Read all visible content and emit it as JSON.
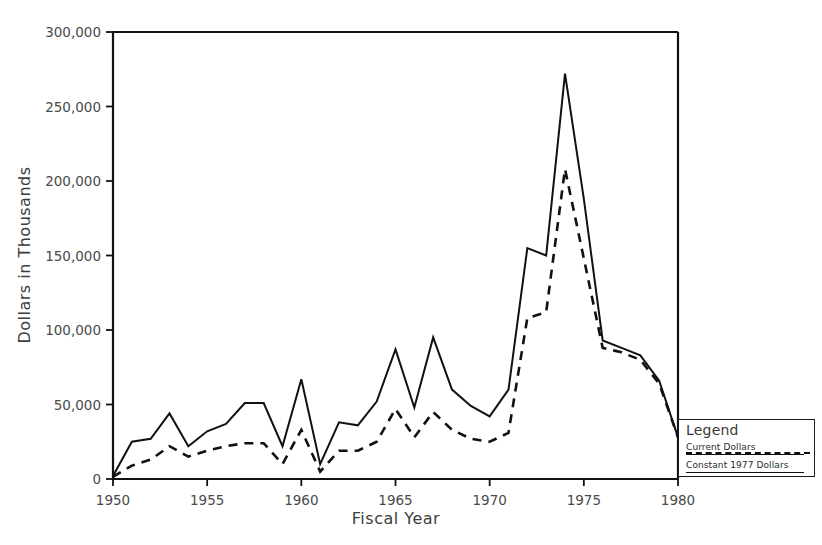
{
  "title": "",
  "axes": {
    "x_title": "Fiscal Year",
    "y_title": "Dollars in Thousands",
    "x_ticks": [
      "1950",
      "1955",
      "1960",
      "1965",
      "1970",
      "1975",
      "1980"
    ],
    "y_ticks": [
      "0",
      "50,000",
      "100,000",
      "150,000",
      "200,000",
      "250,000",
      "300,000"
    ]
  },
  "legend": {
    "title": "Legend",
    "entries": [
      {
        "label": "Current Dollars",
        "style": "solid"
      },
      {
        "label": "Constant 1977 Dollars",
        "style": "dashed"
      }
    ]
  },
  "chart_data": {
    "type": "line",
    "title": "",
    "xlabel": "Fiscal Year",
    "ylabel": "Dollars in Thousands",
    "xlim": [
      1950,
      1980
    ],
    "ylim": [
      0,
      300000
    ],
    "grid": false,
    "legend_position": "right-bottom-outside",
    "x": [
      1950,
      1951,
      1952,
      1953,
      1954,
      1955,
      1956,
      1957,
      1958,
      1959,
      1960,
      1961,
      1962,
      1963,
      1964,
      1965,
      1966,
      1967,
      1968,
      1969,
      1970,
      1971,
      1972,
      1973,
      1974,
      1975,
      1976,
      1977,
      1978,
      1979,
      1980
    ],
    "series": [
      {
        "name": "Current Dollars",
        "style": "solid",
        "values": [
          2000,
          25000,
          27000,
          44000,
          22000,
          32000,
          37000,
          51000,
          51000,
          22000,
          67000,
          10000,
          38000,
          36000,
          52000,
          87000,
          48000,
          95000,
          60000,
          49000,
          42000,
          60000,
          155000,
          150000,
          272000,
          188000,
          93000,
          88000,
          83000,
          66000,
          28000
        ]
      },
      {
        "name": "Constant 1977 Dollars",
        "style": "dashed",
        "values": [
          1500,
          9000,
          13000,
          22000,
          15000,
          19000,
          22000,
          24000,
          24000,
          10000,
          33000,
          5000,
          19000,
          19000,
          25000,
          47000,
          28000,
          45000,
          33000,
          27000,
          25000,
          31000,
          108000,
          112000,
          208000,
          148000,
          88000,
          85000,
          80000,
          64000,
          28000
        ]
      }
    ]
  }
}
